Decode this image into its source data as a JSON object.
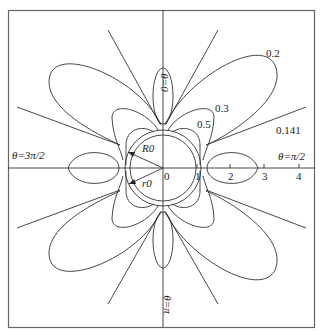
{
  "diagram": {
    "type": "polar field-line diagram",
    "center_label": "0",
    "angle_labels": {
      "top": "θ=0",
      "right": "θ=π/2",
      "bottom": "θ=π",
      "left": "θ=3π/2"
    },
    "axis_ticks": [
      "1",
      "2",
      "3",
      "4"
    ],
    "radius_labels": {
      "outer": "R0",
      "inner": "r0"
    },
    "contour_labels": [
      "0.2",
      "0.3",
      "0.5",
      "0.141"
    ],
    "colors": {
      "line": "#333333",
      "frame": "#555555",
      "background": "#ffffff"
    }
  }
}
